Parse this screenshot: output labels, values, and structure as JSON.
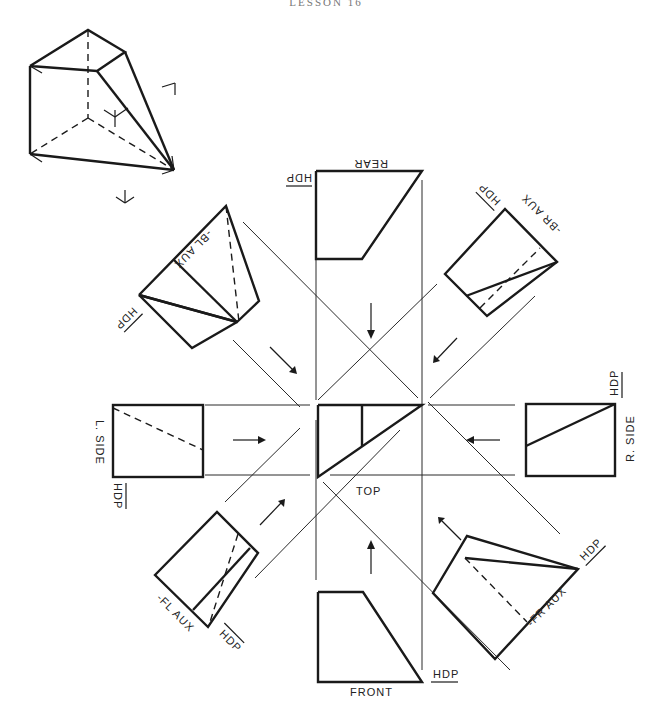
{
  "header": {
    "title": "LESSON 16"
  },
  "views": {
    "top": {
      "label": "TOP"
    },
    "front": {
      "label": "FRONT",
      "hdp": "HDP"
    },
    "rear": {
      "label": "REAR",
      "hdp": "HDP"
    },
    "left_side": {
      "label": "L. SIDE",
      "hdp": "HDP"
    },
    "right_side": {
      "label": "R. SIDE",
      "hdp": "HDP"
    },
    "bl_aux": {
      "label": "-BL AUX",
      "hdp": "HDP"
    },
    "br_aux": {
      "label": "-BR AUX",
      "hdp": "HDP"
    },
    "fl_aux": {
      "label": "-FL AUX",
      "hdp": "HDP"
    },
    "fr_aux": {
      "label": "-FR AUX",
      "hdp": "HDP"
    }
  },
  "pictorial": {
    "description": "isometric pictorial of wedge-shaped solid with viewing direction arrows"
  },
  "colors": {
    "line": "#1a1a1a",
    "background": "#ffffff"
  }
}
